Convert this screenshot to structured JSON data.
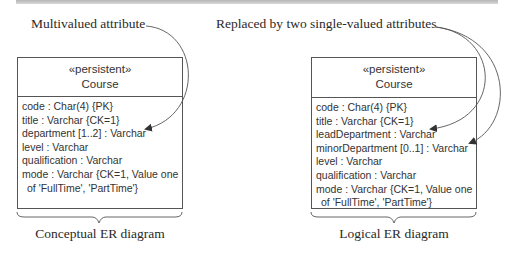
{
  "annotations": {
    "left_note": "Multivalued attribute",
    "right_note": "Replaced by two single-valued attributes"
  },
  "conceptual": {
    "stereotype": "«persistent»",
    "name": "Course",
    "attributes": [
      "code : Char(4) {PK}",
      "title : Varchar {CK=1}",
      "department [1..2] : Varchar",
      "level : Varchar",
      "qualification : Varchar",
      "mode : Varchar {CK=1, Value one",
      "of 'FullTime', 'PartTime'}"
    ],
    "caption": "Conceptual ER diagram"
  },
  "logical": {
    "stereotype": "«persistent»",
    "name": "Course",
    "attributes": [
      "code : Char(4) {PK}",
      "title : Varchar {CK=1}",
      "leadDepartment : Varchar",
      "minorDepartment [0..1] : Varchar",
      "level : Varchar",
      "qualification : Varchar",
      "mode : Varchar {CK=1, Value one",
      "of 'FullTime', 'PartTime'}"
    ],
    "caption": "Logical ER diagram"
  },
  "colors": {
    "line": "#555555",
    "text": "#333333",
    "topbar": "#c4c4c4"
  }
}
